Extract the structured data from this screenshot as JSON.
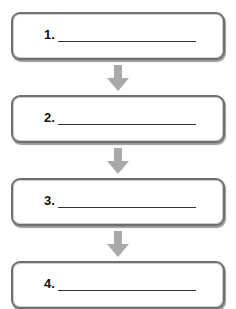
{
  "diagram": {
    "type": "vertical-flowchart",
    "steps": [
      {
        "label": "1.",
        "value": ""
      },
      {
        "label": "2.",
        "value": ""
      },
      {
        "label": "3.",
        "value": ""
      },
      {
        "label": "4.",
        "value": ""
      }
    ],
    "colors": {
      "box_border": "#6f6f6f",
      "arrow": "#a9a9a9"
    }
  }
}
